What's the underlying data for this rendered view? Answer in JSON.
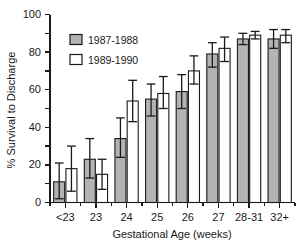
{
  "chart_data": {
    "type": "bar",
    "title": "",
    "xlabel": "Gestational Age (weeks)",
    "ylabel": "% Survival to Discharge",
    "categories": [
      "<23",
      "23",
      "24",
      "25",
      "26",
      "27",
      "28-31",
      "32+"
    ],
    "ylim": [
      0,
      100
    ],
    "yticks": [
      0,
      20,
      40,
      60,
      80,
      100
    ],
    "ytick_labels": [
      "0",
      "20",
      "40",
      "60",
      "80",
      "100"
    ],
    "grid": false,
    "legend_position": "upper-left-inside",
    "series": [
      {
        "name": "1987-1988",
        "color": "#b3b3b3",
        "values": [
          11,
          23,
          34,
          55,
          59,
          79,
          87,
          87
        ],
        "err_low": [
          2,
          13,
          24,
          46,
          50,
          72,
          84,
          82
        ],
        "err_high": [
          21,
          34,
          45,
          63,
          68,
          85,
          90,
          92
        ]
      },
      {
        "name": "1989-1990",
        "color": "#ffffff",
        "values": [
          18,
          15,
          54,
          58,
          70,
          82,
          89,
          89
        ],
        "err_low": [
          6,
          7,
          43,
          50,
          63,
          75,
          87,
          85
        ],
        "err_high": [
          30,
          23,
          65,
          67,
          78,
          88,
          91,
          92
        ]
      }
    ]
  },
  "legend": {
    "entries": [
      {
        "label": "1987-1988",
        "swatch": "filled-gray-square"
      },
      {
        "label": "1989-1990",
        "swatch": "open-white-square"
      }
    ]
  },
  "colors": {
    "series_1987_1988": "#b3b3b3",
    "series_1989_1990": "#ffffff",
    "axis": "#1a1a1a",
    "background": "#ffffff"
  }
}
